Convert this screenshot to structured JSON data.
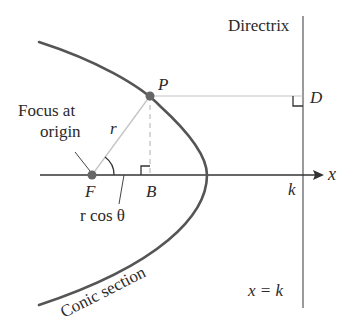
{
  "diagram": {
    "labels": {
      "directrix": "Directrix",
      "point_p": "P",
      "point_d": "D",
      "focus_line1": "Focus at",
      "focus_line2": "origin",
      "r": "r",
      "point_f": "F",
      "point_b": "B",
      "r_cos_theta": "r cos θ",
      "k": "k",
      "x_axis": "x",
      "directrix_eq": "x = k",
      "conic": "Conic section"
    },
    "colors": {
      "curve": "#555555",
      "axis": "#333333",
      "directrix": "#9a9a9a",
      "guide": "#bdbdbd",
      "point": "#666666",
      "text": "#2a2a2a"
    },
    "points": {
      "F": [
        92,
        175
      ],
      "P": [
        150,
        96
      ],
      "B": [
        150,
        175
      ],
      "D": [
        303,
        96
      ],
      "vertex": [
        207,
        175
      ]
    }
  }
}
